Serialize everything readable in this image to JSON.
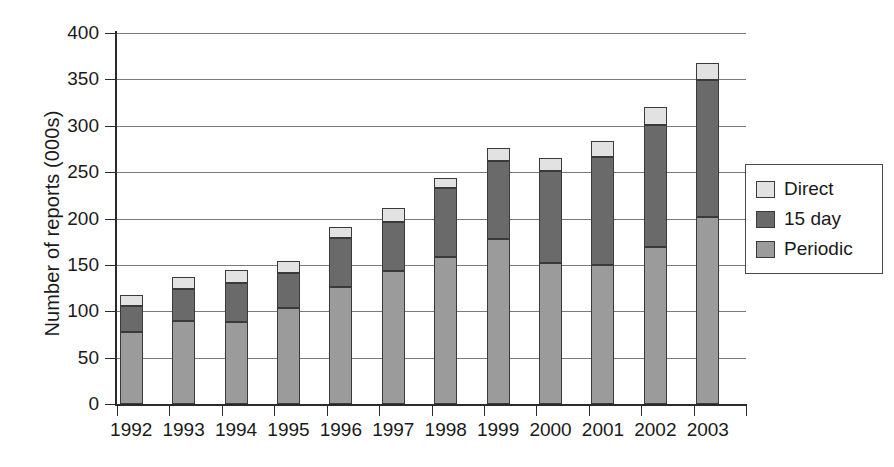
{
  "chart_data": {
    "type": "bar",
    "subtype": "stacked-bar",
    "title": "",
    "xlabel": "",
    "ylabel": "Number of reports (000s)",
    "categories": [
      "1992",
      "1993",
      "1994",
      "1995",
      "1996",
      "1997",
      "1998",
      "1999",
      "2000",
      "2001",
      "2002",
      "2003"
    ],
    "series": [
      {
        "name": "Periodic",
        "color": "#9b9b9b",
        "values": [
          78,
          90,
          88,
          103,
          126,
          143,
          159,
          178,
          152,
          150,
          169,
          202
        ]
      },
      {
        "name": "15 day",
        "color": "#6a6a6a",
        "values": [
          28,
          34,
          42,
          38,
          53,
          53,
          74,
          84,
          99,
          116,
          132,
          147
        ]
      },
      {
        "name": "Direct",
        "color": "#e2e2e2",
        "values": [
          12,
          13,
          14,
          13,
          12,
          15,
          11,
          14,
          14,
          18,
          19,
          19
        ]
      }
    ],
    "totals": [
      118,
      137,
      144,
      154,
      191,
      211,
      244,
      276,
      265,
      284,
      320,
      368
    ],
    "stack_order_bottom_to_top": [
      "Periodic",
      "15 day",
      "Direct"
    ],
    "ylim": [
      0,
      400
    ],
    "yticks": [
      0,
      50,
      100,
      150,
      200,
      250,
      300,
      350,
      400
    ],
    "ytick_labels": [
      "0",
      "50",
      "100",
      "150",
      "200",
      "250",
      "300",
      "350",
      "400"
    ],
    "grid": true,
    "grid_axis": "y",
    "legend_position": "right",
    "legend_entries": [
      {
        "label": "Direct",
        "color": "#e2e2e2"
      },
      {
        "label": "15 day",
        "color": "#6a6a6a"
      },
      {
        "label": "Periodic",
        "color": "#9b9b9b"
      }
    ]
  }
}
